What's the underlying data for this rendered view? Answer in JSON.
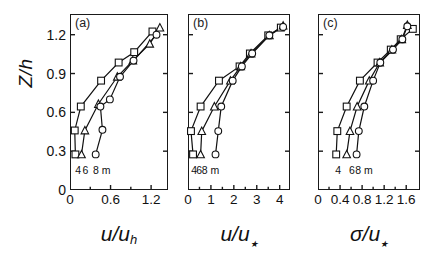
{
  "figure": {
    "ylabel": "Z/h",
    "y_ticks": [
      0,
      0.3,
      0.6,
      0.9,
      1.2
    ],
    "ylim": [
      0,
      1.36
    ],
    "series_names": [
      "4",
      "6",
      "8 m"
    ],
    "series_markers": [
      "square",
      "triangle",
      "circle"
    ],
    "legend_unit": "m"
  },
  "panels": [
    {
      "tag": "(a)",
      "xlabel_num": "u",
      "xlabel_den": "u",
      "xlabel_sub": "h",
      "x_ticks": [
        0,
        0.6,
        1.2
      ],
      "x_minor": [
        0.3,
        0.9
      ],
      "xlim": [
        0,
        1.45
      ],
      "legend_labels": [
        "4",
        "6",
        "8 m"
      ],
      "legend_x": [
        0.09,
        0.2,
        0.44
      ]
    },
    {
      "tag": "(b)",
      "xlabel_num": "u",
      "xlabel_den": "u",
      "xlabel_sub": "*",
      "x_ticks": [
        0,
        1,
        2,
        3,
        4
      ],
      "x_minor": [
        0.5,
        1.5,
        2.5,
        3.5
      ],
      "xlim": [
        0,
        4.45
      ],
      "legend_labels": [
        "4",
        "6",
        "8 m"
      ],
      "legend_x": [
        0.18,
        0.4,
        0.9
      ]
    },
    {
      "tag": "(c)",
      "xlabel_num": "σ",
      "xlabel_den": "u",
      "xlabel_sub": "*",
      "x_ticks": [
        0,
        0.4,
        0.8,
        1.2,
        1.6
      ],
      "x_minor": [
        0.2,
        0.6,
        1.0,
        1.4
      ],
      "xlim": [
        0,
        1.85
      ],
      "legend_labels": [
        "4",
        "6",
        "8 m"
      ],
      "legend_x": [
        0.33,
        0.58,
        0.8
      ]
    }
  ],
  "chart_data": [
    {
      "type": "line",
      "title": "(a)",
      "xlabel": "u/u_h",
      "ylabel": "Z/h",
      "xlim": [
        0,
        1.45
      ],
      "ylim": [
        0,
        1.36
      ],
      "xticks": [
        0,
        0.6,
        1.2
      ],
      "yticks": [
        0,
        0.3,
        0.6,
        0.9,
        1.2
      ],
      "grid": false,
      "legend": [
        "4",
        "6",
        "8 m"
      ],
      "series": [
        {
          "name": "4",
          "marker": "square",
          "x": [
            0.08,
            0.07,
            0.16,
            0.46,
            0.72,
            0.95,
            1.22
          ],
          "y": [
            0.275,
            0.46,
            0.645,
            0.845,
            0.985,
            1.065,
            1.225
          ]
        },
        {
          "name": "6",
          "marker": "triangle",
          "x": [
            0.17,
            0.22,
            0.42,
            0.7,
            0.93,
            1.18,
            1.33
          ],
          "y": [
            0.275,
            0.46,
            0.665,
            0.875,
            1.0,
            1.13,
            1.255
          ]
        },
        {
          "name": "8 m",
          "marker": "circle",
          "x": [
            0.38,
            0.48,
            0.45,
            0.59,
            0.74,
            0.94,
            1.28
          ],
          "y": [
            0.275,
            0.465,
            0.645,
            0.7,
            0.875,
            1.0,
            1.2
          ]
        }
      ]
    },
    {
      "type": "line",
      "title": "(b)",
      "xlabel": "u/u_*",
      "ylabel": "Z/h",
      "xlim": [
        0,
        4.45
      ],
      "ylim": [
        0,
        1.36
      ],
      "xticks": [
        0,
        1,
        2,
        3,
        4
      ],
      "yticks": [
        0,
        0.3,
        0.6,
        0.9,
        1.2
      ],
      "grid": false,
      "legend": [
        "4",
        "6",
        "8 m"
      ],
      "series": [
        {
          "name": "4",
          "marker": "square",
          "x": [
            0.22,
            0.13,
            0.55,
            1.35,
            2.25,
            2.7,
            3.5,
            4.05
          ],
          "y": [
            0.275,
            0.455,
            0.645,
            0.845,
            0.955,
            1.055,
            1.195,
            1.255
          ]
        },
        {
          "name": "6",
          "marker": "triangle",
          "x": [
            0.55,
            0.6,
            1.15,
            1.85,
            2.3,
            2.75,
            3.55,
            4.15
          ],
          "y": [
            0.275,
            0.455,
            0.645,
            0.845,
            0.955,
            1.055,
            1.195,
            1.27
          ]
        },
        {
          "name": "8 m",
          "marker": "circle",
          "x": [
            1.2,
            1.32,
            1.45,
            1.95,
            2.35,
            2.8,
            3.55,
            4.15
          ],
          "y": [
            0.275,
            0.455,
            0.645,
            0.845,
            0.955,
            1.055,
            1.195,
            1.26
          ]
        }
      ]
    },
    {
      "type": "line",
      "title": "(c)",
      "xlabel": "sigma/u_*",
      "ylabel": "Z/h",
      "xlim": [
        0,
        1.85
      ],
      "ylim": [
        0,
        1.36
      ],
      "xticks": [
        0,
        0.4,
        0.8,
        1.2,
        1.6
      ],
      "yticks": [
        0,
        0.3,
        0.6,
        0.9,
        1.2
      ],
      "grid": false,
      "legend": [
        "4",
        "6",
        "8 m"
      ],
      "series": [
        {
          "name": "4",
          "marker": "square",
          "x": [
            0.33,
            0.35,
            0.52,
            0.76,
            1.08,
            1.32,
            1.5,
            1.72
          ],
          "y": [
            0.275,
            0.455,
            0.645,
            0.845,
            0.985,
            1.085,
            1.165,
            1.245
          ]
        },
        {
          "name": "6",
          "marker": "triangle",
          "x": [
            0.52,
            0.58,
            0.71,
            0.93,
            1.12,
            1.34,
            1.52,
            1.62
          ],
          "y": [
            0.275,
            0.455,
            0.645,
            0.845,
            0.985,
            1.085,
            1.165,
            1.275
          ]
        },
        {
          "name": "8 m",
          "marker": "circle",
          "x": [
            0.7,
            0.74,
            0.84,
            1.0,
            1.13,
            1.36,
            1.53,
            1.62
          ],
          "y": [
            0.275,
            0.455,
            0.645,
            0.845,
            0.985,
            1.085,
            1.165,
            1.265
          ]
        }
      ]
    }
  ]
}
